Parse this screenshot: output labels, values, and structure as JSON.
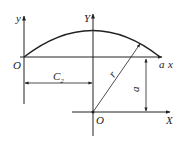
{
  "diagram": {
    "type": "geometry-coordinate-systems",
    "labels": {
      "upper_left_y_axis": "y",
      "upper_left_origin": "O",
      "upper_x_axis_end": "x",
      "arc_endpoint": "a",
      "center_y_axis": "Y",
      "lower_origin": "O",
      "lower_x_axis": "X",
      "horizontal_offset": "C",
      "horizontal_offset_sub": "2",
      "radius": "r",
      "vertical_offset": "a"
    },
    "colors": {
      "line": "#222222",
      "background": "#ffffff"
    }
  }
}
